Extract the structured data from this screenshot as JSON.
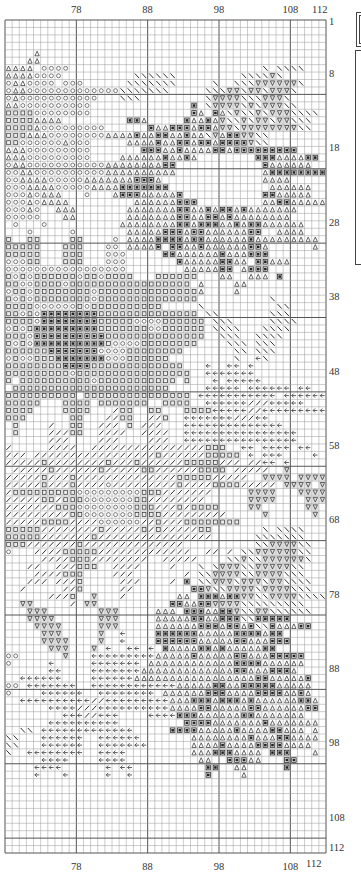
{
  "chart_data": {
    "type": "heatmap",
    "columns": {
      "start": 68,
      "end": 112
    },
    "rows": {
      "start": 1,
      "end": 112
    },
    "x_tick_labels": [
      "78",
      "88",
      "98",
      "108",
      "112"
    ],
    "x_tick_values": [
      78,
      88,
      98,
      108,
      112
    ],
    "y_tick_labels": [
      "1",
      "8",
      "18",
      "28",
      "38",
      "48",
      "58",
      "68",
      "78",
      "88",
      "98",
      "108",
      "112"
    ],
    "y_tick_values": [
      1,
      8,
      18,
      28,
      38,
      48,
      58,
      68,
      78,
      88,
      98,
      108,
      112
    ],
    "major_grid_every": 10,
    "symbol_key": {
      ".": {
        "name": "empty",
        "glyph": ""
      },
      "A": {
        "name": "triangle-up",
        "glyph": "△"
      },
      "O": {
        "name": "circle",
        "glyph": "○"
      },
      "S": {
        "name": "square-outline",
        "glyph": "□"
      },
      "X": {
        "name": "square-filled-cross",
        "glyph": "▣"
      },
      "B": {
        "name": "backslash",
        "glyph": "╲"
      },
      "V": {
        "name": "triangle-down",
        "glyph": "▽"
      },
      "F": {
        "name": "forward-slash",
        "glyph": "╱"
      },
      "L": {
        "name": "left-arrow",
        "glyph": "←"
      }
    },
    "grid_rows": [
      ".............................................",
      ".............................................",
      ".............................................",
      ".............................................",
      "....A........................................",
      "...AA........................................",
      "AAAA.OOOO...........................B.BBBB...",
      "AAAAOOOO..........BBBBBB.........BBBBVB......",
      "OAAOOOO.OOO......BBBBBBB.....B..BBBVVVVVVB...",
      "OAAOOOOOOOOOOOOOBBBBBBB.....BBBVVBVVBVVVB....",
      "OAOOOOOOOOOOO...BBB.........BVVVVBBBVVVB.....",
      "AAOOOOOOOOOO..............X.BVVVVBVBVVVBB....",
      "SSSSOOOOOOOO..............XA.XABVBBVBVVVBBBB.",
      "SSSSAAAA.........XXA.....XAAXAVBBVBVVBVVBBB..",
      "SSSSAOOOOOOOOO......XAAXXXAXXAVVBVVVVVVVVBB..",
      "SSSAAAOOOOOOOOAAAAXAAXXAAXAABVAXXVVBB........",
      "SSOOOOOOAOOO.....AAAAXAAXXAXXAXXXXVBB........",
      "AAAOOOOOOOOO.......XXXAAXAAAAXXAXXXXXXXXX....",
      "AAAOOOOOOOOO....AAAAAAXAAXA........XXXAAAAXX.",
      "OAAOOOOOOOOOOOAAAAAAAAXX............XAAAAAA...",
      "OOAAOOOOOOOOOOAAAAAAAAAA............AXXXXXXXX",
      "OOAAAAOOOOOAAAAAAAXXXA..............AAAA.....",
      "OOOAAAAOOOOOAAAAXXXXXXX..............AAAAAA..",
      "OOOAOAAA...O...AXXXAAAAAX...........XXAAAAA..",
      "OOOAOAAAA.........AAAAAAXXX.........AAXXAAAAAA",
      "OOOAO..AAA.......AAAAAAAXXAAXAXXAXAAAAAAA....",
      "OOOOO...AA.......AAAAAAAXXAAXXAXAAAAAAAA.....",
      ".O...O..........AAAAAAAAXXAXXXAAXAXXAAAAAA...",
      "...O.....O.......AAAAAXXXAXXAAAAAAXX..AAAA...",
      "S..SS....SS....O.AAAAXXXXAXXAAAAAAXAAAAAAAAA.",
      "SSSSS...SSS...OO.AAAAX.XXAAXAAAAAAXXA......A.",
      "SSSSS...SSS...OOO.....XXAAAAAAXAAAXXX........",
      "OOOSS...SSS...OOO.......XAAAAAXXAA.XXAAA.....",
      "OOOOOOOOOOOOOOOOO........AAAAAXX.AXXX........",
      "SOSOSSSSSSOSSOSSSS...SSSSSS...AA..AAA.X......",
      "SSOOSSSSOSSSSSSSSSSSSSSSSS.A....AA..........",
      "OSSOSSSSSSSSOSSSSSSSSSSSSSSA....A...........",
      "SOSOSSSSSSSSOSSSSSSSSSSSSSS..........B.......",
      "SSSSOOOOOOSOSSSSSSSSSS.....B..........BB.....",
      "SSOSOXXXXXXXXSSSSSSSSSSSSSS.BB.......BBB.....",
      "SSSSOXXXXXXXXSSSSSOOOOSSSSSS.BBB.....BBBB....",
      "OSOSXXXXXXXXXSSSSSSSOOSSSSSS.BBBB...BBBB.....",
      "SSSOXXXXXXXXXXSSSSSSSSSSSSSS..BBB..BBBB......",
      "SOSOXXXXXXXXXXSOOOOSSSSSSSS....BBB.BBB.......",
      "SSSSSSXXXXXXXOOOOSSSSSSSS.......BB.BBB.......",
      "OSOOSSSXXXXXXXOOOSSSSSS.........B..LB........",
      "SSSSSSSSXXXXSSSSSSSSSSSSS...L..LL.L.........",
      "SSSSSSSSSOSSSSSSSSSSSSSSSS..LLLLLLL.........",
      "S.SSSSSSSSSSOSSSSSSSSSSS.S...L.LLLLL........",
      ".SSSSSSSSSSSSSSSSSSSSSS.....LLLLL.LLLLLL.LL...",
      "SSSSSSSSSS.SSSSSSSSSSSSSSS.LLLLLLLLLLL.LLLLLL",
      "SSSSS...SSSS.SSSSSSS..SSSS..LLLLLLFFFLLLLL...",
      "SSSS....SSSS...FSS..SS...SSSSLLLLLFFLLLLLLLLL",
      "SSS......SS...FFSS..FFS..LLLLLLLFFFLL.......",
      ".S....F..SS..FFF.S.FFF...LLLLLLLLLLLLLL......",
      ".S....FFFSS..FFFF..FFFF..LLLLLLLLLLLLLLLL....",
      "......FFF....FFF....FFF..LLLLLLLLLLLLLLLL....",
      "F.....FFFF..FFFFFFFFFFFFFFFFSSS..LL.LLLL.LL..",
      "FFF.FFFFFFFFFFFFFFFFFSFFFFFFSSSSS.L.LLL....L",
      "FFFFFSFFFFFFFFSFFFSFFFFFFSSSSSFFF.FFLL.L....",
      ".FFFFFSFFFFFFSFFFFFSSFFFFFFSSSS.FFFFF..V....",
      "FFFFFSFFFSFFFFFFFFFFFFFFSSSSSFFFFF..VVVV.VVVV",
      "FFFFFSFFFSFFFFOFFFFFFFFFSFFFFSSSSFFFFF.VVVV.VVV",
      "FSSSSSSSSSOOOOOOOOOSSSFFFFFFF.....VVVV...VVVV",
      "FFFFFSSFSSSOOOOOOOSSFFFFFFFF......VVVV....VVV",
      "FFFFFFFSSSOOOOOOOOSSSFFFSFSSSS....VV......VV.",
      "FFFFFFFFFSSOOOOOOOSSSSFFFFFFFFF.....V......V.",
      "FFFFFSSSSFFFFOOOOOOFFSFFFSSSSSSSS.............",
      "SSSSSFFFFFFFFSFFFFFSFSFFFFFSS.......B.BBBB...",
      "SSSSSFFFFFFFSFFFFFFFFFFFFFFFF......BBBBBBB...",
      "SSSFFFFFFFSFFFFFFFFFFFFFF..........BBVVVVBB..",
      "O...FFFFSSSSSFFFFFFFFFFFFF..FF.F.BBVVVVVVBB..",
      ".....FFFFSSSFFFFFFFF..FFFFF....BBVBBVVVVVVB..",
      "...FF..FFFSSS..FFFF....F...B.BVVVBBVVVVVBB..",
      "....FFFFSSS....FFF.......F.BBVVVVBBVVVVBBB...",
      "...FFF.FFFS.....FFF....F.X.BBVVVBVVVBVVBBBB..",
      "..F.....FFS.....FF........XXVBBVVVVBVVVVBBB.",
      "......FFFS..V...F.......AA.XXXAXXVVBBVVVVBBBB",
      "..VV.....F.VV..........XXAAXXVVVVBBBBBBBBB...",
      "...VVV.......VVV.....AAA.XXXAAXXVBBVVBBBBBB..",
      "...VVVV......VVV.....AAAAAXXAAXXXBBXXXXX.....",
      "....VVVV.....VVV.....AAAAAAXXXAXXAXBBXAAAXX..",
      ".....VVV.....V..L....XXXXXXAAAAAXXXXAXX.......",
      ".....VVVV....V..L....XXXXXXAAAAAXXAAAXXX......",
      "......VVV...V.L..LL.L.XAAAAXXAXAAAAAXX.......",
      "OO......V...LLLLLLLLLAAAAAXAAAAAXXAAAXXXXX...",
      "O.....L.....LLLLLLL.AAAAAAAAAAAAXXXXAAAAAA...",
      "......LL....LLLLLLLAAAAAAAAAAAAAXXAAAXXXA....",
      "..LLLLLL....LLLLLLAAAAAAAAAAAAAAAAAXXAAAAAX..",
      "OO.LLLLLLL..LLLLLLLLLLLLAAAAAXXAAXXXXXAAAAA..",
      "O....LLLLLL..LLLLLLLL.AAAAAAXXXAAAAXXXXAAXA..",
      "..LLLLLLLLLLFFLLLLLLLLLAAAXXXAXXXAXAAAAAAXXA.",
      "......LLLLFFFLLLLLLLLLLAAAAXXAAAAAXXAAAAAAXX.",
      "........LLLFFLLL....LLLLXXXAAAAAAXXAAAAAAA...",
      "......LLLLLLLLLL.........XXXXAAAAAAAXAAAAAAA.",
      "..BB.LLLLLLLLLLLLL.....XXXXAAAAAXAAAAXXAAA.A..",
      "BB...LLLLLL..LLLLLL.......AAAAAAAAXAAAXXAAAA..",
      "BB...LLLLLL..LLLLLLL......AAAAXAAAAXXXXAAAA...",
      "B..LLLLLLLL..LLLL.........AAAXXXAAAA.XXX...A..",
      ".....LLLL....LLLL..........AA..XXXAA...XX.....",
      "....LLLL......L.LL..........XX..AA.....X......",
      "....L...L.....L..L..........X....A............",
      ".............................................",
      ".............................................",
      ".............................................",
      ".............................................",
      ".............................................",
      ".............................................",
      ".............................................",
      "............................................."
    ]
  },
  "legend_panel": {
    "visible": true,
    "note": "partially cropped legend frame on the right edge"
  }
}
